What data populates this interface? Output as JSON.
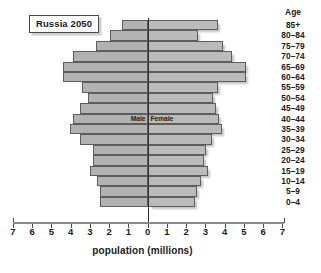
{
  "chart_data": {
    "type": "bar",
    "title": "Russia 2050",
    "subtitle": "",
    "xlabel": "population (millions)",
    "ylabel": "Age",
    "xlim": [
      -7,
      7
    ],
    "grid": false,
    "legend_position": "center-inside",
    "orientation": "horizontal",
    "pyramid": true,
    "x_tick_labels": [
      "7",
      "6",
      "5",
      "4",
      "3",
      "2",
      "1",
      "0",
      "1",
      "2",
      "3",
      "4",
      "5",
      "6",
      "7"
    ],
    "x_tick_values": [
      -7,
      -6,
      -5,
      -4,
      -3,
      -2,
      -1,
      0,
      1,
      2,
      3,
      4,
      5,
      6,
      7
    ],
    "categories": [
      "85+",
      "80-84",
      "75-79",
      "70-74",
      "65-69",
      "60-64",
      "55-59",
      "50-54",
      "45-49",
      "40-44",
      "35-39",
      "30-34",
      "25-29",
      "20-24",
      "15-19",
      "10-14",
      "5-9",
      "0-4"
    ],
    "series": [
      {
        "name": "Male",
        "values": [
          1.35,
          1.95,
          2.7,
          3.85,
          4.4,
          4.4,
          3.4,
          3.1,
          3.5,
          3.9,
          4.05,
          3.5,
          2.85,
          2.85,
          3.0,
          2.65,
          2.45,
          2.45
        ]
      },
      {
        "name": "Female",
        "values": [
          3.65,
          2.6,
          3.9,
          4.4,
          5.1,
          5.1,
          3.65,
          3.4,
          3.55,
          3.7,
          3.85,
          3.35,
          3.05,
          2.95,
          3.15,
          2.8,
          2.55,
          2.45
        ]
      }
    ],
    "annotations": [
      {
        "text": "Male",
        "side": "left"
      },
      {
        "text": "Female",
        "side": "right"
      }
    ],
    "colors": {
      "bar_fill": "#b5b5b5",
      "bar_stroke": "#5d5d5d",
      "axis": "#8a8a8a",
      "center_line": "#2d2d2d",
      "text": "#1a1a1a",
      "background": "#ffffff"
    }
  }
}
